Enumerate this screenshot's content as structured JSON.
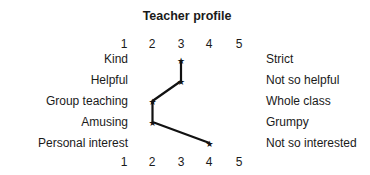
{
  "chart_data": {
    "type": "line",
    "title": "Teacher profile",
    "xlabel": "",
    "ylabel": "",
    "x_ticks": [
      "1",
      "2",
      "3",
      "4",
      "5"
    ],
    "xlim": [
      1,
      5
    ],
    "grid": false,
    "legend": null,
    "orientation": "horizontal semantic differential profile",
    "left_labels": [
      "Kind",
      "Helpful",
      "Group teaching",
      "Amusing",
      "Personal interest"
    ],
    "right_labels": [
      "Strict",
      "Not so helpful",
      "Whole class",
      "Grumpy",
      "Not so interested"
    ],
    "categories": [
      "Kind / Strict",
      "Helpful / Not so helpful",
      "Group teaching / Whole class",
      "Amusing / Grumpy",
      "Personal interest / Not so interested"
    ],
    "values": [
      3,
      3,
      2,
      2,
      4
    ],
    "marker": "star"
  },
  "title": "Teacher profile",
  "top_ticks": [
    "1",
    "2",
    "3",
    "4",
    "5"
  ],
  "bottom_ticks": [
    "1",
    "2",
    "3",
    "4",
    "5"
  ],
  "left_labels": [
    "Kind",
    "Helpful",
    "Group teaching",
    "Amusing",
    "Personal interest"
  ],
  "right_labels": [
    "Strict",
    "Not so helpful",
    "Whole class",
    "Grumpy",
    "Not so interested"
  ],
  "colors": {
    "line": "#111111",
    "text": "#1a1a1a",
    "background": "#ffffff"
  }
}
